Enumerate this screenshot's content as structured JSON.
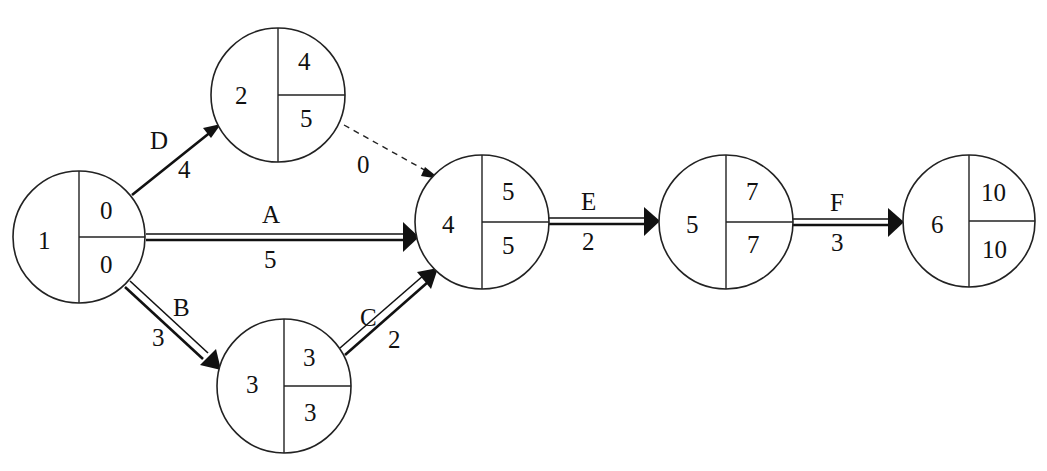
{
  "diagram": {
    "type": "activity-on-arrow network (CPM)",
    "colors": {
      "line": "#111111",
      "background": "#ffffff"
    },
    "nodes": [
      {
        "id": "1",
        "label": "1",
        "earliest": "0",
        "latest": "0"
      },
      {
        "id": "2",
        "label": "2",
        "earliest": "4",
        "latest": "5"
      },
      {
        "id": "3",
        "label": "3",
        "earliest": "3",
        "latest": "3"
      },
      {
        "id": "4",
        "label": "4",
        "earliest": "5",
        "latest": "5"
      },
      {
        "id": "5",
        "label": "5",
        "earliest": "7",
        "latest": "7"
      },
      {
        "id": "6",
        "label": "6",
        "earliest": "10",
        "latest": "10"
      }
    ],
    "edges": [
      {
        "activity": "D",
        "duration": "4",
        "from": "1",
        "to": "2",
        "style": "single",
        "critical": false
      },
      {
        "activity": "A",
        "duration": "5",
        "from": "1",
        "to": "4",
        "style": "double",
        "critical": true
      },
      {
        "activity": "B",
        "duration": "3",
        "from": "1",
        "to": "3",
        "style": "double",
        "critical": true
      },
      {
        "activity": "C",
        "duration": "2",
        "from": "3",
        "to": "4",
        "style": "double",
        "critical": true
      },
      {
        "activity": "",
        "duration": "0",
        "from": "2",
        "to": "4",
        "style": "dashed",
        "critical": false
      },
      {
        "activity": "E",
        "duration": "2",
        "from": "4",
        "to": "5",
        "style": "double",
        "critical": true
      },
      {
        "activity": "F",
        "duration": "3",
        "from": "5",
        "to": "6",
        "style": "double",
        "critical": true
      }
    ]
  }
}
